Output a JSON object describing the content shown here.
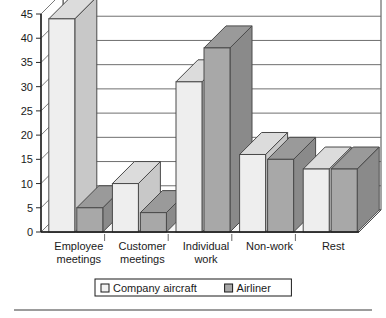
{
  "chart_data": {
    "type": "bar",
    "title": "",
    "subtitle": "",
    "xlabel": "",
    "ylabel": "",
    "ylim": [
      0,
      45
    ],
    "ytick_step": 5,
    "yticks": [
      0,
      5,
      10,
      15,
      20,
      25,
      30,
      35,
      40,
      45
    ],
    "grid": true,
    "three_d": true,
    "legend_position": "bottom",
    "categories": [
      "Employee meetings",
      "Customer meetings",
      "Individual work",
      "Non-work",
      "Rest"
    ],
    "category_lines": [
      [
        "Employee",
        "meetings"
      ],
      [
        "Customer",
        "meetings"
      ],
      [
        "Individual",
        "work"
      ],
      [
        "Non-work",
        ""
      ],
      [
        "Rest",
        ""
      ]
    ],
    "series": [
      {
        "name": "Company aircraft",
        "color": "#eeeeee",
        "top_color": "#dcdcdc",
        "side_color": "#c8c8c8",
        "values": [
          44,
          10,
          31,
          16,
          13
        ]
      },
      {
        "name": "Airliner",
        "color": "#a8a8a8",
        "top_color": "#9a9a9a",
        "side_color": "#8a8a8a",
        "values": [
          5,
          4,
          38,
          15,
          13
        ]
      }
    ]
  },
  "legend": {
    "entries": [
      {
        "label": "Company aircraft",
        "swatch": "#f2f2f2"
      },
      {
        "label": "Airliner",
        "swatch": "#a8a8a8"
      }
    ]
  },
  "footer": {
    "rule": ""
  }
}
